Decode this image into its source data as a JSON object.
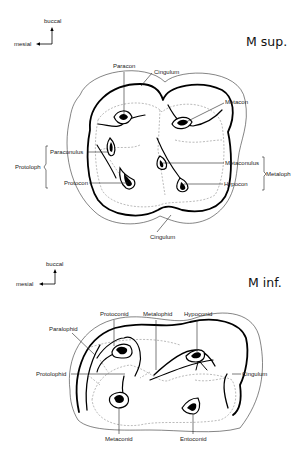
{
  "upper": {
    "title": "M sup.",
    "orientation": {
      "vertical": "buccal",
      "horizontal": "mesial"
    },
    "labels": {
      "paracon": "Paracon",
      "cingulum_top": "Cingulum",
      "metacon": "Metacon",
      "paraconulus": "Paraconulus",
      "protocon": "Protocon",
      "metaconulus": "Metaconulus",
      "hypocon": "Hypocon",
      "cingulum_bottom": "Cingulum",
      "protoloph": "Protoloph",
      "metaloph": "Metaloph"
    }
  },
  "lower": {
    "title": "M inf.",
    "orientation": {
      "vertical": "buccal",
      "horizontal": "mesial"
    },
    "labels": {
      "paralophid": "Paralophid",
      "protoconid": "Protoconid",
      "metalophid": "Metalophid",
      "hypoconid": "Hypoconid",
      "protolophid": "Protolophid",
      "cingulum": "Cingulum",
      "metaconid": "Metaconid",
      "entoconid": "Entoconid"
    }
  }
}
